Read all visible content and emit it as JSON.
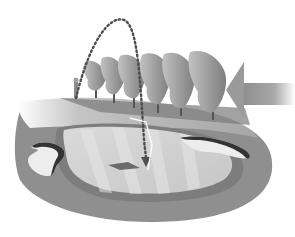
{
  "illustration": {
    "subject": "golf hole with wind bending trees and ball trajectory",
    "colors": {
      "background": "#ffffff",
      "rough": "#8f8f8f",
      "rough_dark": "#7a7a7a",
      "fairway": "#b4b4b4",
      "green": "#d2d2d2",
      "green_stripe": "#e2e2e2",
      "bunker": "#f0f0f0",
      "bunker_lip": "#3a3a3a",
      "tree_light": "#b8b8b8",
      "tree_mid": "#9a9a9a",
      "tree_dark": "#7d7d7d",
      "trajectory": "#555555",
      "wind_arrow": "#9c9c9c"
    },
    "elements": {
      "trees_count": 6,
      "bunkers_count": 2,
      "has_wind_arrow": true,
      "has_golfer": true,
      "has_flag": true
    }
  }
}
